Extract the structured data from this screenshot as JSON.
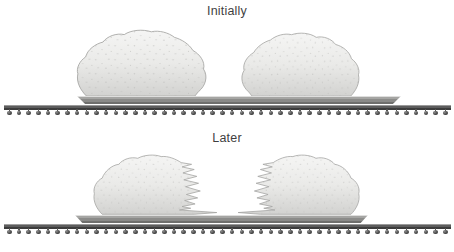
{
  "figure": {
    "panels": [
      {
        "id": "initially",
        "title": "Initially"
      },
      {
        "id": "later",
        "title": "Later"
      }
    ]
  },
  "rack": {
    "ball_count": 46
  },
  "colors": {
    "background": "#ffffff",
    "title_text": "#3f3f3f",
    "dough_light": "#f5f5f4",
    "dough_mid": "#eaeae8",
    "dough_dark": "#d2d2d0",
    "dough_outline": "#a3a3a1",
    "speck": "#b7b7b5",
    "tray_highlight": "#dededd",
    "tray_mid": "#a5a5a3",
    "tray_shadow": "#6f6f6d",
    "rack_bar_light": "#9a9a9a",
    "rack_bar_dark": "#3c3c3c",
    "ball": "#4a4a4a"
  }
}
